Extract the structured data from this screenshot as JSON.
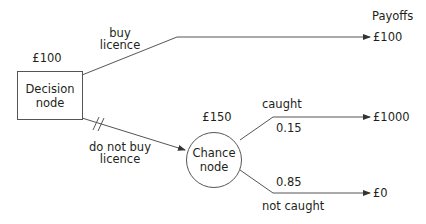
{
  "diagram": {
    "type": "decision-tree",
    "payoffs_header": "Payoffs",
    "decision_node": {
      "label_line1": "Decision",
      "label_line2": "node",
      "value": "£100"
    },
    "chance_node": {
      "label_line1": "Chance",
      "label_line2": "node",
      "value": "£150"
    },
    "branches": [
      {
        "id": "buy",
        "label_line1": "buy",
        "label_line2": "licence",
        "payoff": "£100"
      },
      {
        "id": "not-buy",
        "label_line1": "do not buy",
        "label_line2": "licence",
        "pruned": true
      },
      {
        "id": "caught",
        "label": "caught",
        "probability": "0.15",
        "payoff": "£1000"
      },
      {
        "id": "not-caught",
        "label": "not caught",
        "probability": "0.85",
        "payoff": "£0"
      }
    ],
    "colors": {
      "line": "#555555",
      "text": "#231f20"
    }
  }
}
